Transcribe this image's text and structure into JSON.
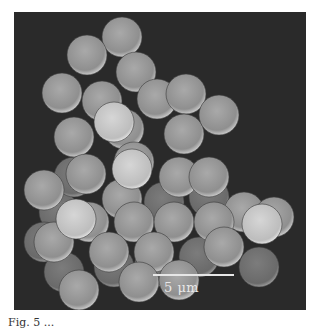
{
  "figure": {
    "type": "SEM micrograph",
    "scale_bar": {
      "label": "5 μm",
      "value": 5,
      "unit": "μm"
    },
    "colors": {
      "background": "#2a2a2a",
      "sphere_light": "#d4d4d4",
      "sphere_dark": "#8a8a8a",
      "scale_bar": "#e6e6e6"
    }
  },
  "caption": {
    "text": "Fig. 5 ..."
  }
}
